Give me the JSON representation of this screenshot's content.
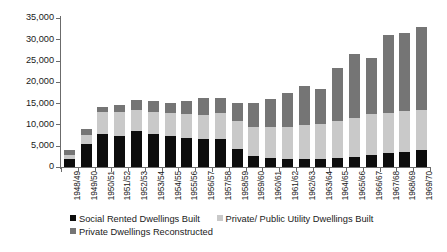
{
  "chart_data": {
    "type": "bar",
    "stacked": true,
    "title": "",
    "xlabel": "",
    "ylabel": "",
    "ylim": [
      0,
      35000
    ],
    "ytick_labels": [
      "35,000",
      "30,000",
      "25,000",
      "20,000",
      "15,000",
      "10,000",
      "5,000",
      "0"
    ],
    "ytick_values": [
      35000,
      30000,
      25000,
      20000,
      15000,
      10000,
      5000,
      0
    ],
    "grid": false,
    "legend_position": "bottom",
    "categories": [
      "1948/49",
      "1949/50",
      "1950/51",
      "1951/52",
      "1952/53",
      "1953/54",
      "1954/55",
      "1955/56",
      "1956/57",
      "1957/58",
      "1958/59",
      "1959/60",
      "1960/61",
      "1961/62",
      "1962/63",
      "1963/64",
      "1964/65",
      "1965/66",
      "1966/67",
      "1967/68",
      "1968/69",
      "1969/70"
    ],
    "series": [
      {
        "name": "Social Rented Dwellings Built",
        "color": "#0d0d0d",
        "values": [
          1800,
          5300,
          7800,
          7300,
          8400,
          7800,
          7200,
          6900,
          6500,
          6500,
          4200,
          2500,
          2000,
          1800,
          1900,
          1900,
          2200,
          2400,
          2900,
          3300,
          3600,
          3900
        ]
      },
      {
        "name": "Private/ Public Utility Dwellings Built",
        "color": "#c9c9c9",
        "values": [
          1000,
          2100,
          5200,
          5700,
          5000,
          5200,
          5400,
          5600,
          5700,
          6200,
          6500,
          6900,
          7400,
          7700,
          8000,
          8200,
          8700,
          9200,
          9500,
          9400,
          9600,
          9600
        ]
      },
      {
        "name": "Private Dwellings Reconstructed",
        "color": "#757575",
        "values": [
          1200,
          1600,
          1000,
          1600,
          2400,
          2400,
          2400,
          3000,
          4100,
          3400,
          4300,
          5600,
          6600,
          8000,
          9100,
          8300,
          12400,
          15000,
          13200,
          18300,
          18300,
          19500
        ]
      }
    ]
  },
  "legend": {
    "items": [
      {
        "label": "Social Rented Dwellings Built",
        "swatch": "seg-a-swatch"
      },
      {
        "label": "Private/ Public Utility Dwellings Built",
        "swatch": "seg-b-swatch"
      },
      {
        "label": "Private Dwellings Reconstructed",
        "swatch": "seg-c-swatch"
      }
    ]
  },
  "colors": {
    "social_rented": "#0d0d0d",
    "private_public_utility": "#c9c9c9",
    "private_reconstructed": "#757575",
    "axis": "#6b6b6b",
    "background": "#ffffff"
  }
}
